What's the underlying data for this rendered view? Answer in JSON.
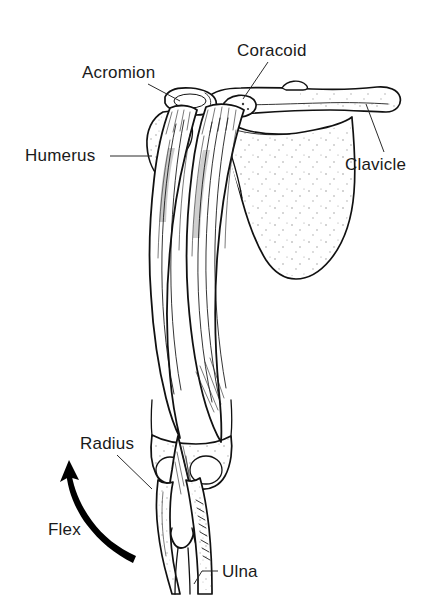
{
  "figure": {
    "background_color": "#ffffff",
    "ink_color": "#111111",
    "labels": [
      {
        "id": "coracoid",
        "text": "Coracoid",
        "x": 237,
        "y": 56
      },
      {
        "id": "acromion",
        "text": "Acromion",
        "x": 82,
        "y": 78
      },
      {
        "id": "humerus",
        "text": "Humerus",
        "x": 25,
        "y": 161
      },
      {
        "id": "clavicle",
        "text": "Clavicle",
        "x": 345,
        "y": 170
      },
      {
        "id": "radius",
        "text": "Radius",
        "x": 80,
        "y": 449
      },
      {
        "id": "flex",
        "text": "Flex",
        "x": 48,
        "y": 535
      },
      {
        "id": "ulna",
        "text": "Ulna",
        "x": 222,
        "y": 577
      }
    ],
    "structures": [
      "clavicle",
      "acromion",
      "coracoid-process",
      "scapula",
      "humerus",
      "biceps-brachii-long-head",
      "biceps-brachii-short-head",
      "biceps-tendon",
      "radius",
      "ulna"
    ],
    "motion_arrow": {
      "name": "flex-arrow",
      "label": "Flex",
      "direction": "counterclockwise-upward"
    }
  }
}
